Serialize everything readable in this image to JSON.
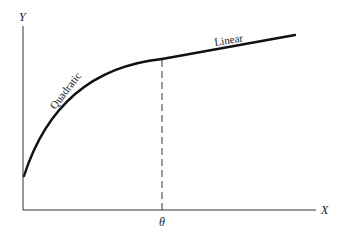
{
  "diagram": {
    "type": "piecewise-function-sketch",
    "axes": {
      "x_label": "X",
      "y_label": "Y"
    },
    "threshold": {
      "label": "θ",
      "style": "dashed"
    },
    "segments": [
      {
        "name": "quadratic",
        "label": "Quadratic",
        "range": "X < θ"
      },
      {
        "name": "linear",
        "label": "Linear",
        "range": "X ≥ θ"
      }
    ],
    "colors": {
      "line": "#111111",
      "axis": "#333333",
      "background": "#ffffff"
    }
  }
}
